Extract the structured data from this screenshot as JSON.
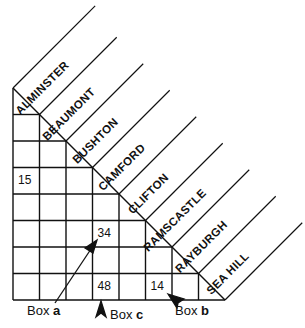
{
  "towns": [
    "ALMINSTER",
    "BEAUMONT",
    "BUSHTON",
    "CAMFORD",
    "CLIFTON",
    "RAMSCASTLE",
    "RAYBURGH",
    "SEA HILL"
  ],
  "cells": [
    {
      "value": "15",
      "row": 3,
      "col": 0
    },
    {
      "value": "34",
      "row": 5,
      "col": 3
    },
    {
      "value": "48",
      "row": 7,
      "col": 3
    },
    {
      "value": "14",
      "row": 7,
      "col": 5
    }
  ],
  "callouts": {
    "box_a": {
      "prefix": "Box ",
      "letter": "a"
    },
    "box_b": {
      "prefix": "Box ",
      "letter": "b"
    },
    "box_c": {
      "prefix": "Box ",
      "letter": "c"
    }
  },
  "colors": {
    "line": "#111111",
    "background": "#ffffff"
  }
}
